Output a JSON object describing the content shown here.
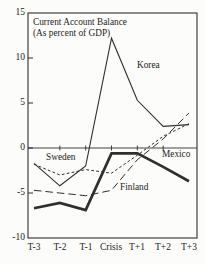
{
  "chart": {
    "title_line1": "Current Account Balance",
    "title_line2": "(As percent of GDP)"
  },
  "chart_data": {
    "type": "line",
    "title": "Current Account Balance (As percent of GDP)",
    "categories": [
      "T-3",
      "T-2",
      "T-1",
      "Crisis",
      "T+1",
      "T+2",
      "T+3"
    ],
    "series": [
      {
        "name": "Korea",
        "style": "thin-solid",
        "values": [
          -1.7,
          -4.2,
          -2.0,
          12.2,
          5.3,
          2.4,
          2.6
        ]
      },
      {
        "name": "Sweden",
        "style": "short-dash",
        "values": [
          -1.8,
          -3.0,
          -2.4,
          -2.8,
          -0.8,
          1.3,
          2.7
        ]
      },
      {
        "name": "Finland",
        "style": "long-dash",
        "values": [
          -4.7,
          -5.0,
          -5.3,
          -4.7,
          -1.3,
          1.0,
          3.9
        ]
      },
      {
        "name": "Mexico",
        "style": "thick-solid",
        "values": [
          -6.7,
          -6.1,
          -6.9,
          -0.6,
          -0.6,
          -2.1,
          -3.7
        ]
      }
    ],
    "y_tick_labels": [
      "15",
      "10",
      "5",
      "0",
      "-5",
      "-10"
    ],
    "y_tick_values": [
      15,
      10,
      5,
      0,
      -5,
      -10
    ],
    "ylim": [
      -10,
      15
    ],
    "xlabel": "",
    "ylabel": "",
    "grid": "zero-line-only",
    "legend": "inline-labels",
    "line_color": "#2f2f2f"
  }
}
